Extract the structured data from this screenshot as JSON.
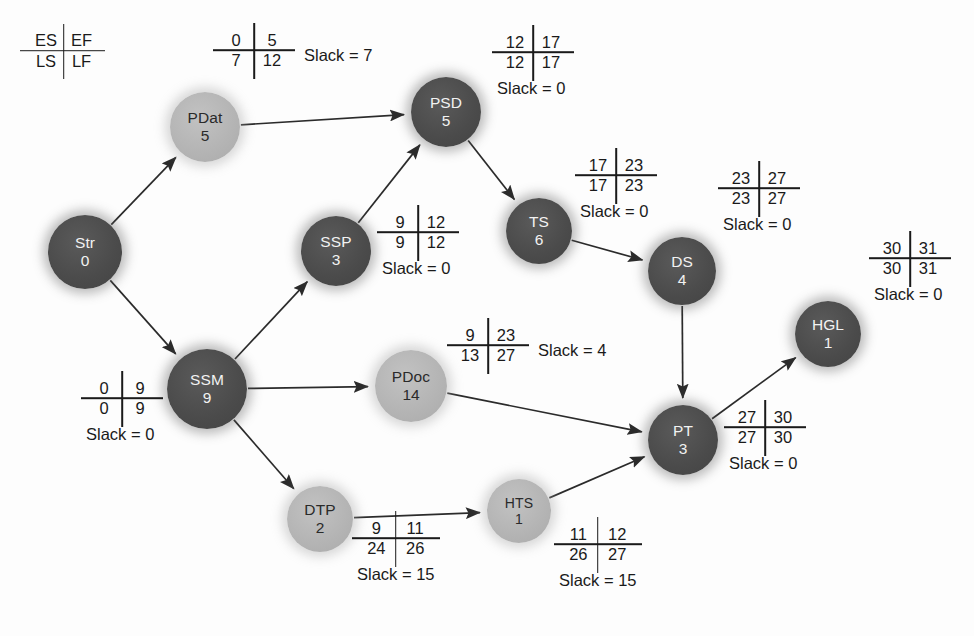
{
  "diagram": {
    "legend": {
      "es": "ES",
      "ef": "EF",
      "ls": "LS",
      "lf": "LF"
    },
    "colors": {
      "critical_node": "#4b4b4b",
      "critical_text": "#f2f2f2",
      "slack_node": "#b4b4b4",
      "slack_text": "#2a2a2a",
      "edge": "#2b2b2b",
      "background": "#fdfdfd"
    },
    "nodes": [
      {
        "id": "Str",
        "label": "Str",
        "duration": "0",
        "x": 85,
        "y": 252,
        "r": 37,
        "critical": true,
        "cell": null
      },
      {
        "id": "PDat",
        "label": "PDat",
        "duration": "5",
        "x": 205,
        "y": 127,
        "r": 35,
        "critical": false,
        "cell": {
          "es": "0",
          "ef": "5",
          "ls": "7",
          "lf": "12",
          "slack": "Slack = 7",
          "lx": 218,
          "ly": 30,
          "layout": "slack-right"
        }
      },
      {
        "id": "PSD",
        "label": "PSD",
        "duration": "5",
        "x": 446,
        "y": 112,
        "r": 35,
        "critical": true,
        "cell": {
          "es": "12",
          "ef": "17",
          "ls": "12",
          "lf": "17",
          "slack": "Slack = 0",
          "lx": 497,
          "ly": 32,
          "layout": "below"
        }
      },
      {
        "id": "SSP",
        "label": "SSP",
        "duration": "3",
        "x": 336,
        "y": 251,
        "r": 35,
        "critical": true,
        "cell": {
          "es": "9",
          "ef": "12",
          "ls": "9",
          "lf": "12",
          "slack": "Slack = 0",
          "lx": 382,
          "ly": 212,
          "layout": "below"
        }
      },
      {
        "id": "TS",
        "label": "TS",
        "duration": "6",
        "x": 539,
        "y": 231,
        "r": 33,
        "critical": true,
        "cell": {
          "es": "17",
          "ef": "23",
          "ls": "17",
          "lf": "23",
          "slack": "Slack = 0",
          "lx": 580,
          "ly": 155,
          "layout": "below"
        }
      },
      {
        "id": "DS",
        "label": "DS",
        "duration": "4",
        "x": 682,
        "y": 271,
        "r": 34,
        "critical": true,
        "cell": {
          "es": "23",
          "ef": "27",
          "ls": "23",
          "lf": "27",
          "slack": "Slack = 0",
          "lx": 723,
          "ly": 168,
          "layout": "below"
        }
      },
      {
        "id": "HGL",
        "label": "HGL",
        "duration": "1",
        "x": 828,
        "y": 334,
        "r": 33,
        "critical": true,
        "cell": {
          "es": "30",
          "ef": "31",
          "ls": "30",
          "lf": "31",
          "slack": "Slack = 0",
          "lx": 874,
          "ly": 238,
          "layout": "below"
        }
      },
      {
        "id": "SSM",
        "label": "SSM",
        "duration": "9",
        "x": 207,
        "y": 389,
        "r": 40,
        "critical": true,
        "cell": {
          "es": "0",
          "ef": "9",
          "ls": "0",
          "lf": "9",
          "slack": "Slack = 0",
          "lx": 86,
          "ly": 378,
          "layout": "below"
        }
      },
      {
        "id": "PDoc",
        "label": "PDoc",
        "duration": "14",
        "x": 411,
        "y": 386,
        "r": 36,
        "critical": false,
        "cell": {
          "es": "9",
          "ef": "23",
          "ls": "13",
          "lf": "27",
          "slack": "Slack = 4",
          "lx": 452,
          "ly": 325,
          "layout": "slack-right"
        }
      },
      {
        "id": "PT",
        "label": "PT",
        "duration": "3",
        "x": 683,
        "y": 440,
        "r": 35,
        "critical": true,
        "cell": {
          "es": "27",
          "ef": "30",
          "ls": "27",
          "lf": "30",
          "slack": "Slack = 0",
          "lx": 729,
          "ly": 407,
          "layout": "below"
        }
      },
      {
        "id": "DTP",
        "label": "DTP",
        "duration": "2",
        "x": 320,
        "y": 519,
        "r": 33,
        "critical": false,
        "cell": {
          "es": "9",
          "ef": "11",
          "ls": "24",
          "lf": "26",
          "slack": "Slack = 15",
          "lx": 357,
          "ly": 518,
          "layout": "below"
        }
      },
      {
        "id": "HTS",
        "label": "HTS",
        "duration": "1",
        "x": 519,
        "y": 511,
        "r": 32,
        "critical": false,
        "cell": {
          "es": "11",
          "ef": "12",
          "ls": "26",
          "lf": "27",
          "slack": "Slack = 15",
          "lx": 559,
          "ly": 524,
          "layout": "below"
        }
      }
    ],
    "edges": [
      {
        "from": "Str",
        "to": "PDat"
      },
      {
        "from": "Str",
        "to": "SSM"
      },
      {
        "from": "PDat",
        "to": "PSD"
      },
      {
        "from": "SSM",
        "to": "SSP"
      },
      {
        "from": "SSM",
        "to": "PDoc"
      },
      {
        "from": "SSM",
        "to": "DTP"
      },
      {
        "from": "SSP",
        "to": "PSD"
      },
      {
        "from": "PSD",
        "to": "TS"
      },
      {
        "from": "TS",
        "to": "DS"
      },
      {
        "from": "DS",
        "to": "PT"
      },
      {
        "from": "PDoc",
        "to": "PT"
      },
      {
        "from": "DTP",
        "to": "HTS"
      },
      {
        "from": "HTS",
        "to": "PT"
      },
      {
        "from": "PT",
        "to": "HGL"
      }
    ]
  }
}
